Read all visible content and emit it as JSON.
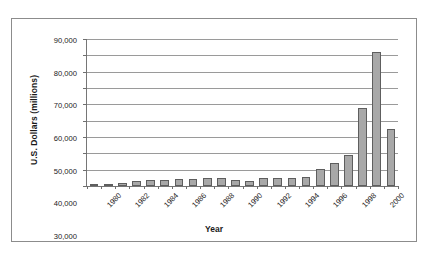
{
  "chart_data": {
    "type": "bar",
    "title": "",
    "xlabel": "Year",
    "ylabel": "U.S. Dollars (millions)",
    "ylim": [
      0,
      90000
    ],
    "ytick_step": 10000,
    "grid": true,
    "legend": "none",
    "bar_color": "#a8a8a8",
    "bar_edge_color": "#5e5e5e",
    "categories": [
      "1980",
      "1981",
      "1982",
      "1983",
      "1984",
      "1985",
      "1986",
      "1987",
      "1988",
      "1989",
      "1990",
      "1991",
      "1992",
      "1993",
      "1994",
      "1995",
      "1996",
      "1997",
      "1998",
      "1999",
      "2000",
      "2001"
    ],
    "values": [
      700,
      1500,
      1700,
      2800,
      3500,
      3500,
      4100,
      4300,
      4900,
      5200,
      3700,
      3100,
      5200,
      5200,
      5200,
      5700,
      10200,
      14000,
      19200,
      48000,
      82000,
      35000
    ],
    "ytick_labels": [
      "90,000",
      "80,000",
      "70,000",
      "60,000",
      "50,000",
      "40,000",
      "30,000",
      "20,000",
      "10,000",
      "0"
    ],
    "ytick_values": [
      90000,
      80000,
      70000,
      60000,
      50000,
      40000,
      30000,
      20000,
      10000,
      0
    ],
    "xtick_labels": [
      "1980",
      "1982",
      "1984",
      "1986",
      "1988",
      "1990",
      "1992",
      "1994",
      "1996",
      "1998",
      "2000"
    ],
    "xtick_categories": [
      "1980",
      "1982",
      "1984",
      "1986",
      "1988",
      "1990",
      "1992",
      "1994",
      "1996",
      "1998",
      "2000"
    ]
  },
  "caption": {
    "text": ""
  }
}
